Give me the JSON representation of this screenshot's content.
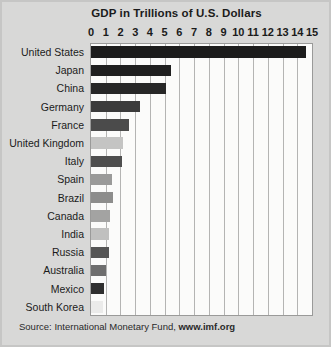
{
  "figure": {
    "title": "GDP in Trillions of U.S. Dollars",
    "background_color": "#d8d8d7",
    "plot_background_color": "#fbfbfa",
    "gridline_color": "#b4b4b3"
  },
  "source": {
    "prefix": "Source: International Monetary Fund,",
    "url": "www.imf.org"
  },
  "chart_data": {
    "type": "bar",
    "orientation": "horizontal",
    "title": "GDP in Trillions of U.S. Dollars",
    "xlabel": "",
    "ylabel": "",
    "xlim": [
      0,
      15
    ],
    "xticks": [
      0,
      1,
      2,
      3,
      4,
      5,
      6,
      7,
      8,
      9,
      10,
      11,
      12,
      13,
      14,
      15
    ],
    "xtick_labels": [
      "0",
      "1",
      "2",
      "3",
      "4",
      "5",
      "6",
      "7",
      "8",
      "9",
      "10",
      "11",
      "12",
      "13",
      "14",
      "15"
    ],
    "grid": true,
    "legend": false,
    "categories": [
      "United States",
      "Japan",
      "China",
      "Germany",
      "France",
      "United Kingdom",
      "Italy",
      "Spain",
      "Brazil",
      "Canada",
      "India",
      "Russia",
      "Australia",
      "Mexico",
      "South Korea"
    ],
    "values": [
      14.6,
      5.4,
      5.1,
      3.3,
      2.6,
      2.2,
      2.1,
      1.4,
      1.5,
      1.3,
      1.2,
      1.2,
      1.0,
      0.9,
      0.8
    ],
    "bar_colors": [
      "#1c1c1c",
      "#1f1f1f",
      "#272727",
      "#3b3b3b",
      "#4b4b4b",
      "#c4c4c3",
      "#4e4e4e",
      "#9a9a99",
      "#8d8d8c",
      "#a3a3a2",
      "#c0c0bf",
      "#555555",
      "#6e6e6e",
      "#2f2f2f",
      "#ebebea"
    ]
  }
}
